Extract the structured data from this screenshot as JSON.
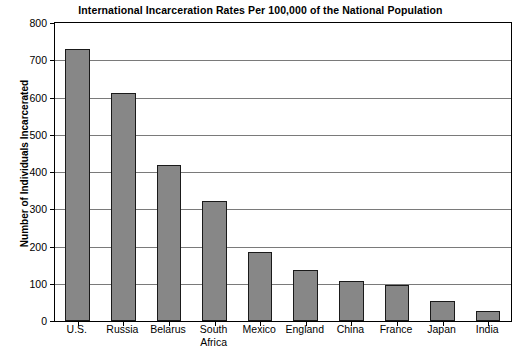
{
  "chart_data": {
    "type": "bar",
    "title": "International Incarceration Rates Per 100,000 of the National Population",
    "xlabel": "",
    "ylabel": "Number of Individuals Incarcerated",
    "categories": [
      "U.S.",
      "Russia",
      "Belarus",
      "South Africa",
      "Mexico",
      "England",
      "China",
      "France",
      "Japan",
      "India"
    ],
    "category_lines": [
      [
        "U.S."
      ],
      [
        "Russia"
      ],
      [
        "Belarus"
      ],
      [
        "South",
        "Africa"
      ],
      [
        "Mexico"
      ],
      [
        "England"
      ],
      [
        "China"
      ],
      [
        "France"
      ],
      [
        "Japan"
      ],
      [
        "India"
      ]
    ],
    "values": [
      730,
      613,
      418,
      322,
      184,
      136,
      108,
      98,
      54,
      27
    ],
    "ylim": [
      0,
      800
    ],
    "ytick_labels": [
      "800",
      "700",
      "600",
      "500",
      "400",
      "300",
      "200",
      "100",
      "0"
    ],
    "ytick_values": [
      800,
      700,
      600,
      500,
      400,
      300,
      200,
      100,
      0
    ],
    "grid": true,
    "legend": null,
    "bar_color": "#878787",
    "bar_border_color": "#1a1a1a",
    "grid_color": "#7a7a7a",
    "axis_color": "#000000",
    "background": "#ffffff"
  }
}
